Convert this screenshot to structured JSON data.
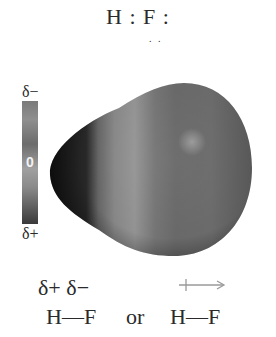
{
  "lewis_structure": {
    "text": "H : F :",
    "lone_pair_below": ". ."
  },
  "scale": {
    "top_label": "δ−",
    "middle_label": "0",
    "bottom_label": "δ+"
  },
  "molecule": {
    "name": "HF electrostatic potential map",
    "colors": {
      "hydrogen_end": "#1e1e1e",
      "band": "#8c8c8c",
      "fluorine_body": "#6b6b6b",
      "highlight": "#9a9a9a"
    }
  },
  "notation": {
    "partial_charges": "δ+ δ−",
    "left_formula": "H—F",
    "or_label": "or",
    "right_formula": "H—F",
    "dipole_arrow": "dipole-arrow",
    "arrow_color": "#9a9a9a"
  }
}
